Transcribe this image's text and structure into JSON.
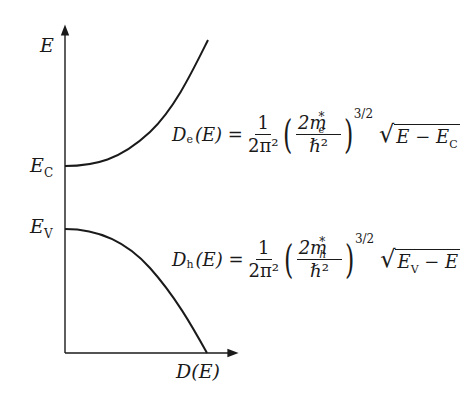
{
  "diagram": {
    "type": "density-of-states band diagram",
    "axes": {
      "y_label": "E",
      "x_label": "D(E)",
      "y_ticks": [
        {
          "label": "E",
          "sub": "C",
          "name": "conduction-band-edge"
        },
        {
          "label": "E",
          "sub": "V",
          "name": "valence-band-edge"
        }
      ]
    },
    "curves": [
      {
        "name": "electron-dos",
        "shape": "sqrt rising from E_C",
        "color": "#1a1a1a"
      },
      {
        "name": "hole-dos",
        "shape": "sqrt rising below E_V",
        "color": "#1a1a1a"
      }
    ],
    "equations": {
      "electron": {
        "lhs": "D",
        "lhs_sub": "e",
        "arg": "(E) =",
        "frac1_num": "1",
        "frac1_den": "2π²",
        "frac2_num": "2m",
        "mass_sub": "e",
        "star": "*",
        "frac2_den": "ℏ²",
        "power": "3/2",
        "sqrt_a": "E − E",
        "sqrt_a_sub": "C",
        "sqrt_b": ""
      },
      "hole": {
        "lhs": "D",
        "lhs_sub": "h",
        "arg": "(E) =",
        "frac1_num": "1",
        "frac1_den": "2π²",
        "frac2_num": "2m",
        "mass_sub": "h",
        "star": "*",
        "frac2_den": "ℏ²",
        "power": "3/2",
        "sqrt_a": "E",
        "sqrt_a_sub": "V",
        "sqrt_b": " − E"
      }
    }
  }
}
